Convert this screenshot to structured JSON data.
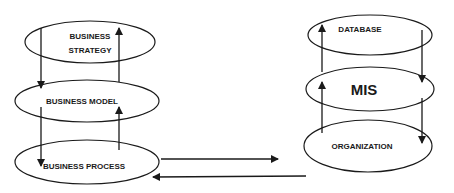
{
  "diagram": {
    "left_stack": {
      "nodes": [
        {
          "id": "business-strategy",
          "lines": [
            "BUSINESS",
            "STRATEGY"
          ]
        },
        {
          "id": "business-model",
          "lines": [
            "BUSINESS MODEL"
          ]
        },
        {
          "id": "business-process",
          "lines": [
            "BUSINESS PROCESS"
          ]
        }
      ]
    },
    "right_stack": {
      "nodes": [
        {
          "id": "database",
          "lines": [
            "DATABASE"
          ]
        },
        {
          "id": "mis",
          "lines": [
            "MIS"
          ]
        },
        {
          "id": "organization",
          "lines": [
            "ORGANIZATION"
          ]
        }
      ]
    },
    "edges": [
      {
        "from": "business-strategy",
        "to": "business-model"
      },
      {
        "from": "business-model",
        "to": "business-strategy"
      },
      {
        "from": "business-model",
        "to": "business-process"
      },
      {
        "from": "business-process",
        "to": "business-model"
      },
      {
        "from": "organization",
        "to": "mis"
      },
      {
        "from": "mis",
        "to": "database"
      },
      {
        "from": "database",
        "to": "mis"
      },
      {
        "from": "mis",
        "to": "organization"
      },
      {
        "from": "business-process",
        "to": "organization"
      },
      {
        "from": "organization",
        "to": "business-process"
      }
    ]
  }
}
